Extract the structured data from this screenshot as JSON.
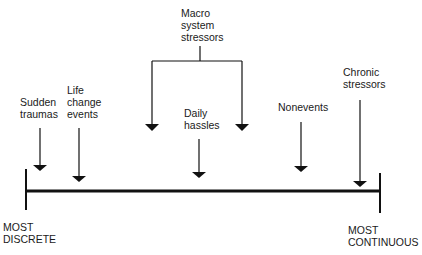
{
  "diagram": {
    "type": "continuum",
    "axis": {
      "left_label": "MOST\nDISCRETE",
      "right_label": "MOST\nCONTINUOUS"
    },
    "stressors": [
      {
        "id": "sudden-traumas",
        "label": "Sudden\ntraumas"
      },
      {
        "id": "life-change-events",
        "label": "Life\nchange\nevents"
      },
      {
        "id": "macro-system-stressors",
        "label": "Macro\nsystem\nstressors"
      },
      {
        "id": "daily-hassles",
        "label": "Daily\nhassles"
      },
      {
        "id": "nonevents",
        "label": "Nonevents"
      },
      {
        "id": "chronic-stressors",
        "label": "Chronic\nstressors"
      }
    ],
    "colors": {
      "line": "#111111",
      "text": "#1a1a1a",
      "background": "#ffffff"
    }
  }
}
